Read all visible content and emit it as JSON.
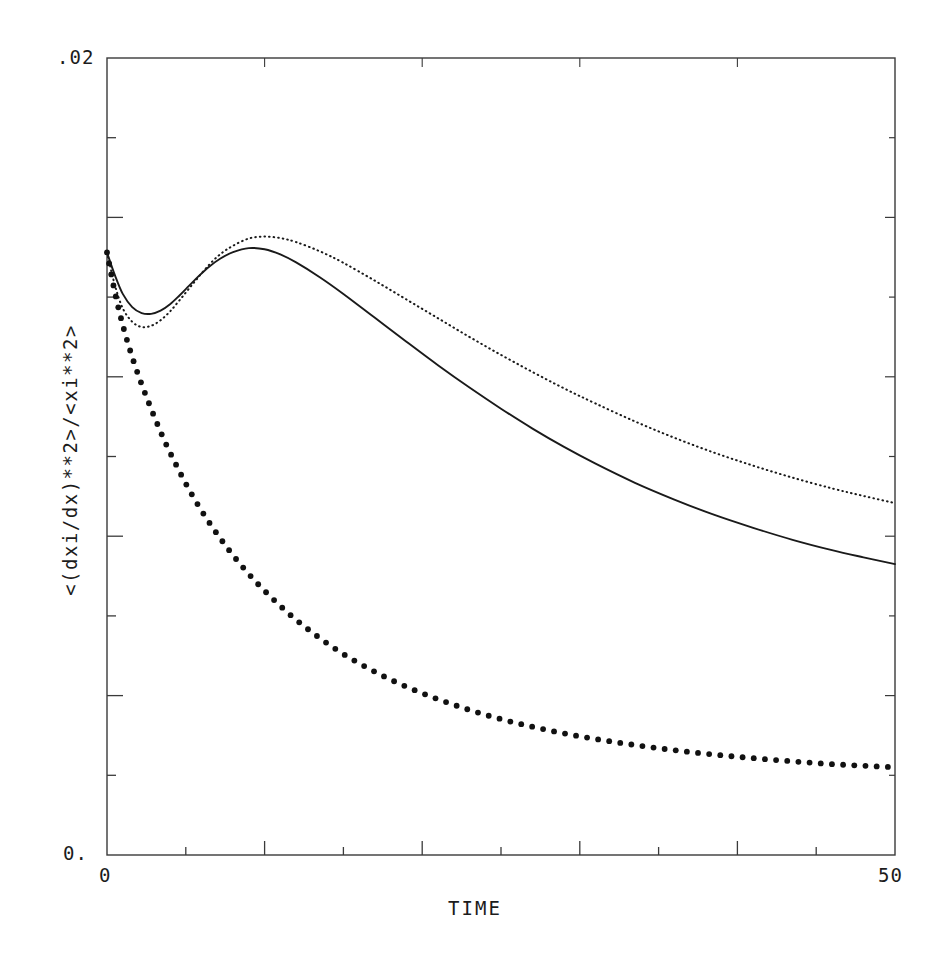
{
  "chart_data": {
    "type": "line",
    "title": "",
    "xlabel": "TIME",
    "ylabel": "<(dxi/dx)**2>/<xi**2>",
    "xlim": [
      0,
      50
    ],
    "ylim": [
      0,
      0.02
    ],
    "xticklabels": [
      "0",
      "50"
    ],
    "yticklabels": [
      ".02",
      "0."
    ],
    "x_tick_count": 10,
    "y_tick_count": 10,
    "grid": false,
    "legend": "none",
    "frame": "box",
    "series": [
      {
        "name": "solid-curve",
        "style": "solid",
        "color": "#1a1a1a",
        "x": [
          0.0,
          0.5,
          1.0,
          1.6,
          2.2,
          2.8,
          3.4,
          4.0,
          4.6,
          5.2,
          5.8,
          6.5,
          7.2,
          8.0,
          9.0,
          10.0,
          11.0,
          12.0,
          13.5,
          15.0,
          17.0,
          19.0,
          21.0,
          23.0,
          25.0,
          27.0,
          29.0,
          31.0,
          33.5,
          36.0,
          38.5,
          41.0,
          43.5,
          46.0,
          48.0,
          50.0
        ],
        "y": [
          0.01512,
          0.01455,
          0.01408,
          0.01375,
          0.0136,
          0.01358,
          0.01366,
          0.01382,
          0.01404,
          0.01428,
          0.01452,
          0.01477,
          0.01497,
          0.01513,
          0.01523,
          0.0152,
          0.01507,
          0.01487,
          0.0145,
          0.01408,
          0.01348,
          0.01288,
          0.01229,
          0.01173,
          0.0112,
          0.0107,
          0.01024,
          0.00982,
          0.00934,
          0.00892,
          0.00854,
          0.00821,
          0.00791,
          0.00765,
          0.00747,
          0.0073
        ]
      },
      {
        "name": "fine-dotted-curve",
        "style": "dotted-fine",
        "color": "#1a1a1a",
        "x": [
          0.0,
          0.5,
          1.0,
          1.6,
          2.2,
          2.8,
          3.4,
          4.0,
          4.6,
          5.2,
          5.8,
          6.5,
          7.2,
          8.0,
          9.0,
          10.0,
          11.0,
          12.0,
          13.5,
          15.0,
          17.0,
          19.0,
          21.0,
          23.0,
          25.0,
          27.0,
          29.0,
          31.0,
          33.5,
          36.0,
          38.5,
          41.0,
          43.5,
          46.0,
          48.0,
          50.0
        ],
        "y": [
          0.01512,
          0.0143,
          0.01372,
          0.01338,
          0.01325,
          0.01328,
          0.01342,
          0.01364,
          0.01392,
          0.01421,
          0.0145,
          0.01482,
          0.01508,
          0.01529,
          0.01547,
          0.01552,
          0.01548,
          0.01538,
          0.01515,
          0.01486,
          0.01441,
          0.01394,
          0.01347,
          0.013,
          0.01255,
          0.01212,
          0.01171,
          0.01133,
          0.01088,
          0.01047,
          0.0101,
          0.00977,
          0.00947,
          0.0092,
          0.00901,
          0.00883
        ]
      },
      {
        "name": "bold-dotted-curve",
        "style": "dotted-bold",
        "color": "#111111",
        "x": [
          0.0,
          0.5,
          1.0,
          1.5,
          2.0,
          2.5,
          3.0,
          3.5,
          4.0,
          5.0,
          6.0,
          7.0,
          8.0,
          9.0,
          10.0,
          11.5,
          13.0,
          14.5,
          16.0,
          18.0,
          20.0,
          22.0,
          24.0,
          26.0,
          28.5,
          31.0,
          33.5,
          36.0,
          38.5,
          41.0,
          43.5,
          46.0,
          48.0,
          50.0
        ],
        "y": [
          0.01512,
          0.01412,
          0.0133,
          0.01262,
          0.01203,
          0.0115,
          0.011,
          0.01053,
          0.0101,
          0.00932,
          0.00864,
          0.00805,
          0.00752,
          0.00705,
          0.00663,
          0.00607,
          0.00559,
          0.00517,
          0.00481,
          0.0044,
          0.00406,
          0.00377,
          0.00352,
          0.00331,
          0.00309,
          0.00291,
          0.00276,
          0.00263,
          0.00252,
          0.00243,
          0.00235,
          0.00228,
          0.00224,
          0.0022
        ]
      }
    ]
  },
  "plot_geometry": {
    "left": 107,
    "right": 895,
    "top": 58,
    "bottom": 855
  },
  "axes": {
    "y_top_label": ".02",
    "y_bottom_label": "0.",
    "x_left_label": "0",
    "x_right_label": "50",
    "x_title": "TIME",
    "y_title": "<(dxi/dx)**2>/<xi**2>"
  },
  "colors": {
    "background": "#ffffff",
    "ink": "#1a1a1a",
    "axis": "#3a3a3a"
  }
}
